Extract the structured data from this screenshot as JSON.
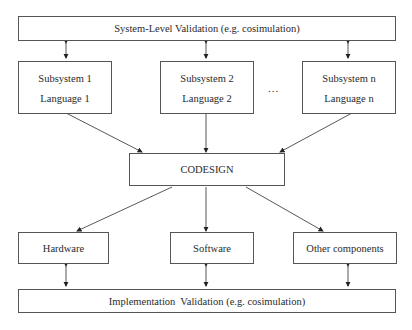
{
  "diagram": {
    "top_validation": "System-Level Validation (e.g. cosimulation)",
    "subsystems": [
      {
        "name": "Subsystem 1",
        "language": "Language 1"
      },
      {
        "name": "Subsystem 2",
        "language": "Language 2"
      },
      {
        "name": "Subsystem n",
        "language": "Language n"
      }
    ],
    "ellipsis": "...",
    "codesign": "CODESIGN",
    "components": [
      "Hardware",
      "Software",
      "Other components"
    ],
    "bottom_validation": "Implementation  Validation (e.g. cosimulation)"
  }
}
